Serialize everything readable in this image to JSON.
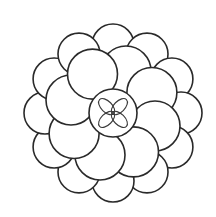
{
  "figure": {
    "colors": {
      "line": "#2a2a2a",
      "background": "#ffffff"
    },
    "center": {
      "x": 113,
      "y": 113
    },
    "outer_ring": {
      "count": 12,
      "radius": 68,
      "circle_r": 21
    },
    "middle_ring": {
      "count": 8,
      "radius": 44,
      "circle_r": 25
    },
    "center_circle": {
      "r": 24
    },
    "petals": {
      "count": 4
    }
  }
}
